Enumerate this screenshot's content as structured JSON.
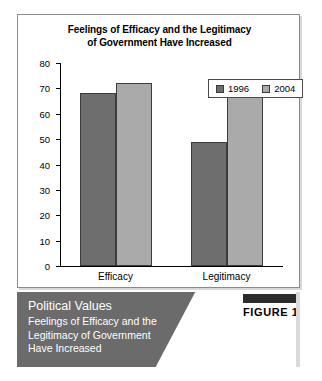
{
  "chart_data": {
    "type": "bar",
    "title": "Feelings of Efficacy and the Legitimacy of Government Have Increased",
    "title_lines": [
      "Feelings of Efficacy and the Legitimacy",
      "of Government Have Increased"
    ],
    "categories": [
      "Efficacy",
      "Legitimacy"
    ],
    "series": [
      {
        "name": "1996",
        "values": [
          68,
          49
        ],
        "color": "#6e6e6e"
      },
      {
        "name": "2004",
        "values": [
          72,
          68
        ],
        "color": "#aaaaaa"
      }
    ],
    "xlabel": "",
    "ylabel": "",
    "ylim": [
      0,
      80
    ],
    "yticks": [
      0,
      10,
      20,
      30,
      40,
      50,
      60,
      70,
      80
    ],
    "grid": false,
    "legend_position": "top-right"
  },
  "caption": {
    "heading": "Political Values",
    "subtitle_lines": [
      "Feelings of Efficacy and the",
      "Legitimacy of Government",
      "Have Increased"
    ],
    "figure_number": "FIGURE 17.8"
  },
  "colors": {
    "series_1996": "#6e6e6e",
    "series_2004": "#aaaaaa",
    "banner": "#6b6b6b",
    "badge_bar": "#2b2b2b"
  }
}
